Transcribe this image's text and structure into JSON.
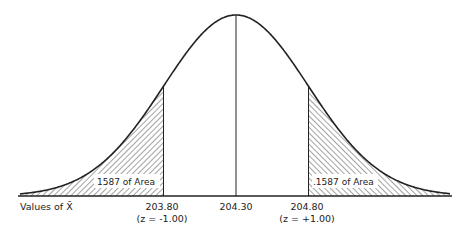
{
  "diagram": {
    "type": "normal-distribution",
    "mean": 204.3,
    "sd": 0.5,
    "shaded_regions": [
      {
        "side": "left",
        "upper_bound": 203.8,
        "label": "1587 of Area"
      },
      {
        "side": "right",
        "lower_bound": 204.8,
        "label": ".1587 of Area"
      }
    ],
    "axis_title": "Values of X̄",
    "ticks": [
      {
        "value": "203.80",
        "z_label": "(z = -1.00)"
      },
      {
        "value": "204.30",
        "z_label": ""
      },
      {
        "value": "204.80",
        "z_label": "(z = +1.00)"
      }
    ],
    "colors": {
      "ink": "#222222",
      "background": "#ffffff"
    }
  }
}
